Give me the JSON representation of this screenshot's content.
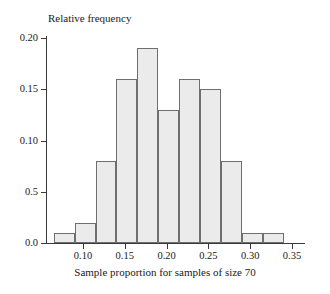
{
  "chart_data": {
    "type": "bar",
    "title": "",
    "subtitle": "",
    "xlabel": "Sample proportion for samples of size 70",
    "ylabel": "Relative frequency",
    "grid": false,
    "legend": "none",
    "xlim": [
      0.055,
      0.365
    ],
    "ylim": [
      0.0,
      0.2
    ],
    "bin_width": 0.025,
    "bin_edges": [
      0.065,
      0.09,
      0.115,
      0.14,
      0.165,
      0.19,
      0.215,
      0.24,
      0.265,
      0.29,
      0.315,
      0.34
    ],
    "categories": [
      "0.065-0.090",
      "0.090-0.115",
      "0.115-0.140",
      "0.140-0.165",
      "0.165-0.190",
      "0.190-0.215",
      "0.215-0.240",
      "0.240-0.265",
      "0.265-0.290",
      "0.290-0.315",
      "0.315-0.340"
    ],
    "values": [
      0.01,
      0.02,
      0.08,
      0.16,
      0.19,
      0.13,
      0.16,
      0.15,
      0.08,
      0.01,
      0.01
    ],
    "x_ticks": [
      0.1,
      0.15,
      0.2,
      0.25,
      0.3,
      0.35
    ],
    "x_tick_labels": [
      "0.10",
      "0.15",
      "0.20",
      "0.25",
      "0.30",
      "0.35"
    ],
    "y_ticks": [
      0.0,
      0.05,
      0.1,
      0.15,
      0.2
    ],
    "y_tick_labels": [
      "0.0",
      "0.5",
      "0.10",
      "0.15",
      "0.20"
    ],
    "bar_fill_color": "#ebebeb",
    "bar_edge_color": "#6f6f6f",
    "axis_color": "#3a3a3a",
    "background_color": "#ffffff"
  }
}
